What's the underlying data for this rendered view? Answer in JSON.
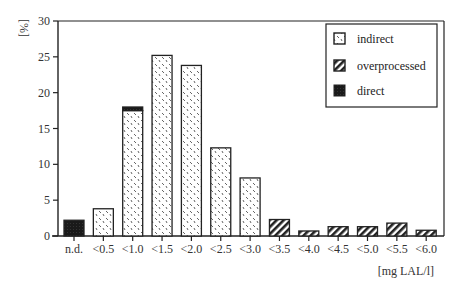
{
  "chart_data": {
    "type": "bar",
    "stacked": true,
    "title": "",
    "xlabel": "[mg LAL/l]",
    "ylabel": "[%]",
    "ylim": [
      0,
      30
    ],
    "yticks": [
      0,
      5,
      10,
      15,
      20,
      25,
      30
    ],
    "grid": false,
    "legend_position": "top-right",
    "categories": [
      "n.d.",
      "<0.5",
      "<1.0",
      "<1.5",
      "<2.0",
      "<2.5",
      "<3.0",
      "<3.5",
      "<4.0",
      "<4.5",
      "<5.0",
      "<5.5",
      "<6.0"
    ],
    "series": [
      {
        "name": "indirect",
        "pattern": "dotted-dash",
        "values": [
          0,
          3.8,
          17.5,
          25.2,
          23.8,
          12.3,
          8.1,
          0,
          0,
          0,
          0,
          0,
          0
        ]
      },
      {
        "name": "overprocessed",
        "pattern": "diagonal-hatch",
        "values": [
          0,
          0,
          0,
          0,
          0,
          0,
          0,
          2.3,
          0.7,
          1.3,
          1.3,
          1.8,
          0.8
        ]
      },
      {
        "name": "direct",
        "pattern": "solid-dark",
        "values": [
          2.2,
          0,
          0.5,
          0,
          0,
          0,
          0,
          0,
          0,
          0,
          0,
          0,
          0
        ]
      }
    ]
  },
  "axis": {
    "ylabel": "[%]",
    "xlabel": "[mg LAL/l]",
    "yticks": [
      "0",
      "5",
      "10",
      "15",
      "20",
      "25",
      "30"
    ]
  },
  "legend": {
    "items": [
      {
        "label": "indirect"
      },
      {
        "label": "overprocessed"
      },
      {
        "label": "direct"
      }
    ]
  },
  "colors": {
    "direct": "#1a1a1a",
    "axis": "#222222"
  }
}
